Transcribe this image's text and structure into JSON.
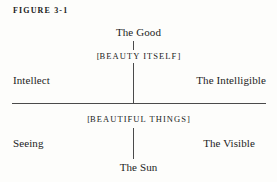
{
  "figure": {
    "number_label": "FIGURE 3-1",
    "colors": {
      "background": "#fdfdfb",
      "text": "#1c1c1c",
      "line": "#4a4a4a"
    }
  },
  "diagram": {
    "type": "divided-line",
    "axis": {
      "horizontal_divider": true,
      "vertical_connector": true
    },
    "nodes": {
      "top": "The Good",
      "upper_middle_open": "[",
      "upper_middle": "BEAUTY ITSELF",
      "upper_middle_close": "]",
      "lower_middle_open": "[",
      "lower_middle": "BEAUTIFUL THINGS",
      "lower_middle_close": "]",
      "bottom": "The Sun"
    },
    "sides": {
      "upper_left": "Intellect",
      "upper_right": "The Intelligible",
      "lower_left": "Seeing",
      "lower_right": "The Visible"
    }
  }
}
